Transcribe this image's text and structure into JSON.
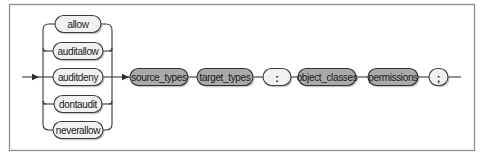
{
  "diagram": {
    "type": "railroad-syntax-diagram",
    "frame": {
      "x": 9,
      "y": 4,
      "width": 465,
      "height": 146
    },
    "main_line_y": 77,
    "colors": {
      "terminal_fill": "#f1f1ef",
      "nonterminal_fill": "#a9a9a7",
      "line": "#3a3a3a",
      "frame": "#8c8c8c"
    },
    "choice_group": {
      "name": "rule_type",
      "rail_left_x": 43,
      "rail_right_x": 112,
      "options": [
        {
          "label": "allow",
          "kind": "terminal",
          "x": 55,
          "y": 24,
          "width": 46
        },
        {
          "label": "auditallow",
          "kind": "terminal",
          "x": 53,
          "y": 51,
          "width": 50
        },
        {
          "label": "auditdeny",
          "kind": "terminal",
          "x": 53,
          "y": 77,
          "width": 50
        },
        {
          "label": "dontaudit",
          "kind": "terminal",
          "x": 54,
          "y": 104,
          "width": 48
        },
        {
          "label": "neverallow",
          "kind": "terminal",
          "x": 53,
          "y": 130,
          "width": 50
        }
      ]
    },
    "sequence": [
      {
        "label": "source_types",
        "kind": "nonterminal",
        "x": 130,
        "width": 58
      },
      {
        "label": "target_types",
        "kind": "nonterminal",
        "x": 197,
        "width": 56
      },
      {
        "label": ":",
        "kind": "terminal",
        "x": 263,
        "width": 28
      },
      {
        "label": "object_classes",
        "kind": "nonterminal",
        "x": 298,
        "width": 58
      },
      {
        "label": "permissions",
        "kind": "nonterminal",
        "x": 368,
        "width": 50
      },
      {
        "label": ";",
        "kind": "terminal",
        "x": 429,
        "width": 19
      }
    ],
    "entry_x": 22,
    "exit_x": 461
  }
}
